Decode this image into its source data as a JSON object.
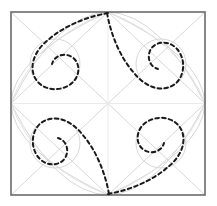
{
  "figure": {
    "type": "line-diagram",
    "canvas": {
      "width": 217,
      "height": 206,
      "background": "#ffffff"
    },
    "colors": {
      "frame": "#6b6b6b",
      "construction": "#d8d8d8",
      "construction_light": "#e2e2e2",
      "curve": "#1a1a1a",
      "axis": "#e8e8e8"
    },
    "strokes": {
      "frame_width": 1.6,
      "construction_width": 1.0,
      "curve_width": 2.0,
      "axis_width": 0.9,
      "curve_dash": "3.6 3.2"
    },
    "frame": {
      "label": "bounding-square",
      "x0": 11,
      "y0": 12,
      "x1": 205,
      "y1": 195,
      "width": 194,
      "height": 183
    },
    "center": {
      "x": 108,
      "y": 103.5
    },
    "midpoints": {
      "top": {
        "x": 108,
        "y": 12
      },
      "right": {
        "x": 205,
        "y": 103.5
      },
      "bottom": {
        "x": 108,
        "y": 195
      },
      "left": {
        "x": 11,
        "y": 103.5
      }
    },
    "axes": [
      {
        "name": "vertical-axis",
        "x1": 108,
        "y1": 12,
        "x2": 108,
        "y2": 195
      },
      {
        "name": "horizontal-axis",
        "x1": 11,
        "y1": 103.5,
        "x2": 205,
        "y2": 103.5
      }
    ],
    "diagonals": [
      {
        "name": "diagonal-top-left",
        "x1": 108,
        "y1": 12,
        "x2": 11,
        "y2": 103.5
      },
      {
        "name": "diagonal-top-right",
        "x1": 108,
        "y1": 12,
        "x2": 205,
        "y2": 103.5
      },
      {
        "name": "diagonal-bottom-right",
        "x1": 205,
        "y1": 103.5,
        "x2": 108,
        "y2": 195
      },
      {
        "name": "diagonal-bottom-left",
        "x1": 108,
        "y1": 195,
        "x2": 11,
        "y2": 103.5
      }
    ],
    "quadrant_diagonals": [
      {
        "name": "quad-diag-tl",
        "x1": 11,
        "y1": 12,
        "x2": 108,
        "y2": 103.5
      },
      {
        "name": "quad-diag-tr",
        "x1": 205,
        "y1": 12,
        "x2": 108,
        "y2": 103.5
      },
      {
        "name": "quad-diag-br",
        "x1": 205,
        "y1": 195,
        "x2": 108,
        "y2": 103.5
      },
      {
        "name": "quad-diag-bl",
        "x1": 11,
        "y1": 195,
        "x2": 108,
        "y2": 103.5
      }
    ],
    "construction_circles": [
      {
        "name": "circle-top-left",
        "cx": 55,
        "cy": 64,
        "r": 25
      },
      {
        "name": "circle-top-right",
        "cx": 161,
        "cy": 64,
        "r": 25
      },
      {
        "name": "circle-bottom-right",
        "cx": 161,
        "cy": 143,
        "r": 25
      },
      {
        "name": "circle-bottom-left",
        "cx": 55,
        "cy": 143,
        "r": 25
      }
    ],
    "construction_arcs": [
      {
        "name": "arc-top-bulge",
        "d": "M 11 103.5 Q 56 14 108 12 Q 160 14 205 103.5"
      },
      {
        "name": "arc-right-bulge",
        "d": "M 108 12 Q 203 56 205 103.5 Q 203 151 108 195"
      },
      {
        "name": "arc-bottom-bulge",
        "d": "M 205 103.5 Q 160 193 108 195 Q 56 193 11 103.5"
      },
      {
        "name": "arc-left-bulge",
        "d": "M 108 195 Q 13 151 11 103.5 Q 13 56 108 12"
      }
    ],
    "construction_inner_arcs": [
      {
        "name": "inner-arc-tl",
        "d": "M 11 103.5 Q 34 40 108 12"
      },
      {
        "name": "inner-arc-tr",
        "d": "M 108 12 Q 180 40 205 103.5"
      },
      {
        "name": "inner-arc-br",
        "d": "M 205 103.5 Q 180 167 108 195"
      },
      {
        "name": "inner-arc-bl",
        "d": "M 108 195 Q 34 167 11 103.5"
      }
    ],
    "spiral_curves": [
      {
        "name": "spiral-top-left",
        "description": "dashed teardrop from top midpoint sweeping left and coiling into the top-left circle",
        "d": "M 108 13 C 86 17 64 26 48 40 C 33 52 28 69 37 81 C 45 91 62 92 72 83 C 81 75 80 62 72 57 C 64 52 54 56 52 64"
      },
      {
        "name": "spiral-top-right",
        "description": "dashed teardrop from top midpoint sweeping right and coiling into the top-right circle",
        "d": "M 107 13 C 111 35 120 57 134 73 C 146 88 163 93 175 84 C 185 76 186 59 177 49 C 169 40 156 41 151 49 C 146 57 150 67 158 69"
      },
      {
        "name": "spiral-bottom-right",
        "description": "dashed teardrop from bottom midpoint sweeping right and coiling into the bottom-right circle",
        "d": "M 108 194 C 130 190 152 181 168 167 C 183 155 188 138 179 126 C 171 116 154 115 144 124 C 135 132 136 145 144 150 C 152 155 162 151 164 143"
      },
      {
        "name": "spiral-bottom-left",
        "description": "dashed teardrop from bottom midpoint sweeping left and coiling into the bottom-left circle",
        "d": "M 109 194 C 105 172 96 150 82 134 C 70 119 53 114 41 123 C 31 131 30 148 39 158 C 47 167 60 166 65 158 C 70 150 66 140 58 138"
      }
    ]
  }
}
